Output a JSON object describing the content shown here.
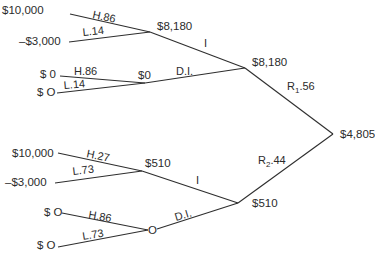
{
  "diagram": {
    "type": "decision-tree",
    "root": {
      "value": "$4,805"
    },
    "branches": {
      "r1": {
        "label": "R",
        "sub": "1",
        "prob": ".56",
        "node_value": "$8,180"
      },
      "r2": {
        "label": "R",
        "sub": "2",
        "prob": ".44",
        "node_value": "$510"
      }
    },
    "upper": {
      "i_label": "I",
      "di_label": "D.I.",
      "i_node": {
        "value": "$8,180",
        "outcomes": [
          {
            "label": "H.86",
            "value": "$10,000"
          },
          {
            "label": "L.14",
            "value": "–$3,000"
          }
        ]
      },
      "di_node": {
        "value": "$0",
        "outcomes": [
          {
            "label": "H.86",
            "value": "$ 0"
          },
          {
            "label": "L.14",
            "value": "$ O"
          }
        ]
      }
    },
    "lower": {
      "i_label": "I",
      "di_label": "D.I.",
      "i_node": {
        "value": "$510",
        "outcomes": [
          {
            "label": "H.27",
            "value": "$10,000"
          },
          {
            "label": "L.73",
            "value": "–$3,000"
          }
        ]
      },
      "di_node": {
        "value": "O",
        "outcomes": [
          {
            "label": "H.86",
            "value": "$ O"
          },
          {
            "label": "L.73",
            "value": "$ O"
          }
        ]
      }
    }
  }
}
